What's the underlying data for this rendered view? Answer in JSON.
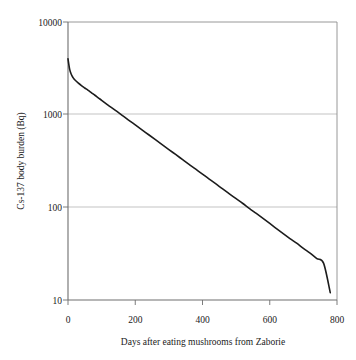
{
  "chart_data": {
    "type": "line",
    "title": "",
    "xlabel": "Days after eating mushrooms from Zaborie",
    "ylabel": "Cs-137 body burden (Bq)",
    "yscale": "log",
    "xlim": [
      0,
      800
    ],
    "ylim": [
      10,
      10000
    ],
    "xticks": [
      0,
      200,
      400,
      600,
      800
    ],
    "xtick_labels": [
      "0",
      "200",
      "400",
      "600",
      "800"
    ],
    "yticks": [
      10,
      100,
      1000,
      10000
    ],
    "ytick_labels": [
      "10",
      "100",
      "1000",
      "10000"
    ],
    "grid": "horizontal",
    "grid_color": "#b8b8b8",
    "frame_color": "#808080",
    "legend": "none",
    "series": [
      {
        "name": "Cs-137 body burden",
        "color": "#1c1c1c",
        "line_width": 1.6,
        "x": [
          0,
          5,
          10,
          15,
          20,
          30,
          40,
          50,
          60,
          70,
          80,
          90,
          100,
          110,
          120,
          140,
          160,
          180,
          200,
          220,
          240,
          260,
          280,
          300,
          320,
          340,
          360,
          380,
          400,
          420,
          440,
          460,
          480,
          500,
          520,
          540,
          560,
          580,
          600,
          620,
          640,
          660,
          680,
          700,
          720,
          740,
          760,
          780
        ],
        "y": [
          4000,
          3080,
          2710,
          2510,
          2380,
          2200,
          2060,
          1940,
          1830,
          1720,
          1620,
          1520,
          1430,
          1340,
          1260,
          1120,
          990,
          875,
          775,
          686,
          607,
          537,
          475,
          420,
          372,
          329,
          291,
          258,
          228,
          202,
          179,
          158,
          140,
          124,
          110,
          97,
          86,
          76,
          67,
          59,
          52,
          46,
          41,
          36,
          32,
          28,
          25,
          12
        ]
      }
    ],
    "annotations": {
      "start_value_bq": 4000,
      "end_value_bq": 12,
      "end_day": 780,
      "crosses_1000_bq_at_day": 160,
      "crosses_100_bq_at_day": 450
    }
  },
  "axes": {
    "y_title": "Cs-137 body burden (Bq)",
    "x_title": "Days after eating mushrooms from Zaborie",
    "y_labels": [
      "10000",
      "1000",
      "100",
      "10"
    ],
    "x_labels": [
      "0",
      "200",
      "400",
      "600",
      "800"
    ]
  }
}
